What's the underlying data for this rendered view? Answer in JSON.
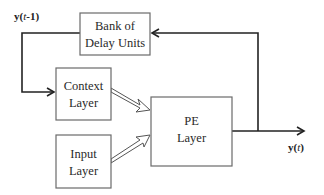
{
  "diagram": {
    "nodes": {
      "delay": {
        "line1": "Bank of",
        "line2": "Delay Units"
      },
      "context": {
        "line1": "Context",
        "line2": "Layer"
      },
      "input": {
        "line1": "Input",
        "line2": "Layer"
      },
      "pe": {
        "line1": "PE",
        "line2": "Layer"
      }
    },
    "labels": {
      "feedback_prefix": "y(",
      "feedback_var": "t",
      "feedback_suffix": "-1)",
      "output_prefix": "y(",
      "output_var": "t",
      "output_suffix": ")"
    },
    "edges": [
      {
        "from": "delay",
        "to": "context",
        "style": "line-arrow",
        "label": "y(t-1)"
      },
      {
        "from": "context",
        "to": "pe",
        "style": "hollow-arrow"
      },
      {
        "from": "input",
        "to": "pe",
        "style": "hollow-arrow"
      },
      {
        "from": "pe",
        "to": "output",
        "style": "line-arrow",
        "label": "y(t)"
      },
      {
        "from": "pe",
        "to": "delay",
        "style": "line-arrow"
      }
    ]
  }
}
